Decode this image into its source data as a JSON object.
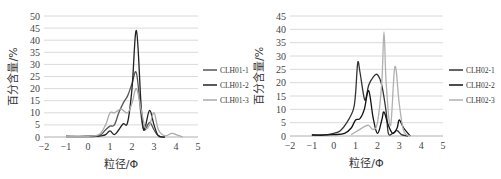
{
  "chart_data": [
    {
      "type": "line",
      "title": "",
      "xlabel": "粒径/Φ",
      "ylabel": "百分含量/%",
      "xlim": [
        -2,
        5
      ],
      "ylim": [
        0,
        50
      ],
      "xticks": [
        "-2",
        "-1",
        "0",
        "1",
        "2",
        "3",
        "4",
        "5"
      ],
      "yticks": [
        "0",
        "5",
        "10",
        "15",
        "20",
        "25",
        "30",
        "35",
        "40",
        "45",
        "50"
      ],
      "grid": "horizontal",
      "legend_position": "right",
      "series": [
        {
          "name": "CLH01-1",
          "color": "#555555",
          "x": [
            -1,
            0,
            0.4,
            0.6,
            0.8,
            1.0,
            1.2,
            1.4,
            1.6,
            1.8,
            2.0,
            2.2,
            2.4,
            2.5,
            2.6,
            2.8,
            3.0,
            3.2,
            3.5
          ],
          "y": [
            0.3,
            0.3,
            0.5,
            1,
            3,
            4.5,
            5,
            10,
            14,
            17,
            22,
            26.5,
            10,
            4,
            3,
            6,
            3,
            0.5,
            0
          ]
        },
        {
          "name": "CLH01-2",
          "color": "#222222",
          "x": [
            -1,
            0,
            0.4,
            0.6,
            0.8,
            1.0,
            1.2,
            1.4,
            1.6,
            1.8,
            2.0,
            2.2,
            2.4,
            2.5,
            2.6,
            2.8,
            3.0,
            3.2,
            3.5
          ],
          "y": [
            0.2,
            0.2,
            0.3,
            0.5,
            1,
            2.5,
            1,
            3,
            5.5,
            6,
            20,
            44,
            15,
            4,
            4,
            11,
            5,
            0.5,
            0
          ]
        },
        {
          "name": "CLH01-3",
          "color": "#aaaaaa",
          "x": [
            -1,
            0,
            0.5,
            0.8,
            1.0,
            1.2,
            1.5,
            1.8,
            2.0,
            2.2,
            2.4,
            2.6,
            2.8,
            3.0,
            3.2,
            3.5,
            3.8,
            4.0,
            4.3
          ],
          "y": [
            0.3,
            0.3,
            1,
            5,
            10,
            10,
            11.5,
            10,
            14,
            20,
            12,
            4,
            5,
            10,
            3,
            0.5,
            1.5,
            1,
            0
          ]
        }
      ]
    },
    {
      "type": "line",
      "title": "",
      "xlabel": "粒径/Φ",
      "ylabel": "百分含量/%",
      "xlim": [
        -2,
        5
      ],
      "ylim": [
        0,
        45
      ],
      "xticks": [
        "-2",
        "-1",
        "0",
        "1",
        "2",
        "3",
        "4",
        "5"
      ],
      "yticks": [
        "0",
        "5",
        "10",
        "15",
        "20",
        "25",
        "30",
        "35",
        "40",
        "45"
      ],
      "grid": "horizontal",
      "legend_position": "right",
      "series": [
        {
          "name": "CLH02-1",
          "color": "#333333",
          "x": [
            -1,
            -0.5,
            0,
            0.3,
            0.6,
            0.9,
            1.0,
            1.1,
            1.2,
            1.4,
            1.5,
            1.6,
            1.8,
            2.0,
            2.2,
            2.4,
            2.5,
            2.7,
            2.9,
            3.1,
            3.4
          ],
          "y": [
            0.5,
            0.3,
            1,
            2,
            5,
            10,
            16,
            27.5,
            24,
            14,
            15,
            19,
            22,
            23,
            19,
            9,
            1,
            1,
            2,
            0.5,
            0
          ]
        },
        {
          "name": "CLH02-2",
          "color": "#111111",
          "x": [
            -1,
            0,
            0.5,
            0.8,
            1.0,
            1.2,
            1.4,
            1.6,
            1.8,
            2.0,
            2.2,
            2.3,
            2.5,
            2.7,
            2.9,
            3.0,
            3.2,
            3.5
          ],
          "y": [
            0.3,
            0.5,
            1,
            3,
            6,
            6.5,
            10,
            17,
            7,
            1,
            6,
            9,
            4,
            1,
            3,
            6,
            3,
            0
          ]
        },
        {
          "name": "CLH02-3",
          "color": "#b0b0b0",
          "x": [
            0.8,
            1.0,
            1.2,
            1.4,
            1.6,
            1.8,
            2.0,
            2.2,
            2.3,
            2.4,
            2.6,
            2.8,
            3.0,
            3.2,
            3.5
          ],
          "y": [
            0.5,
            1.5,
            2.5,
            3.5,
            4,
            2.5,
            5,
            20,
            39,
            20,
            4,
            26,
            12,
            2,
            0
          ]
        }
      ]
    }
  ]
}
